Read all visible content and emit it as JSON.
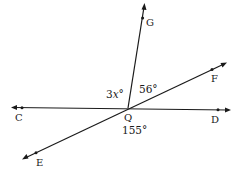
{
  "diagram": {
    "type": "geometry-angles",
    "vertex": {
      "name": "Q",
      "label": "Q"
    },
    "points": {
      "C": {
        "label": "C"
      },
      "D": {
        "label": "D"
      },
      "E": {
        "label": "E"
      },
      "F": {
        "label": "F"
      },
      "G": {
        "label": "G"
      }
    },
    "lines": [
      "line CD",
      "line EF",
      "ray QG"
    ],
    "angles": {
      "CQG": {
        "label": "3x°",
        "var": "3",
        "var_x": "x",
        "deg": "°"
      },
      "GQF": {
        "label": "56°"
      },
      "EQD": {
        "label": "155°"
      }
    },
    "colors": {
      "stroke": "#1a1a1a",
      "background": "#ffffff"
    }
  }
}
